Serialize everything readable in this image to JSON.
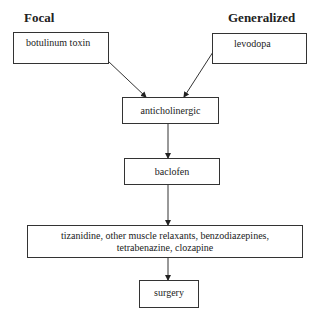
{
  "headers": {
    "left": "Focal",
    "right": "Generalized"
  },
  "nodes": {
    "botulinum": "botulinum toxin",
    "levodopa": "levodopa",
    "anticholinergic": "anticholinergic",
    "baclofen": "baclofen",
    "others_line1": "tizanidine, other muscle relaxants, benzodiazepines,",
    "others_line2": "tetrabenazine, clozapine",
    "surgery": "surgery"
  },
  "edges": [
    {
      "from": "botulinum toxin",
      "to": "anticholinergic"
    },
    {
      "from": "levodopa",
      "to": "anticholinergic"
    },
    {
      "from": "anticholinergic",
      "to": "baclofen"
    },
    {
      "from": "baclofen",
      "to": "tizanidine, other muscle relaxants, benzodiazepines, tetrabenazine, clozapine"
    },
    {
      "from": "tizanidine, other muscle relaxants, benzodiazepines, tetrabenazine, clozapine",
      "to": "surgery"
    }
  ]
}
